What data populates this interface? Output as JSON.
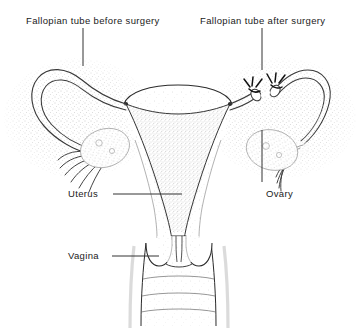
{
  "figure": {
    "background_color": "#ffffff",
    "ink_color": "#1a1a1a",
    "stipple_color": "#8d8d8d",
    "width": 357,
    "height": 333
  },
  "labels": {
    "fallopian_tube_before": "Fallopian tube before surgery",
    "fallopian_tube_after": "Fallopian tube after surgery",
    "uterus": "Uterus",
    "vagina": "Vagina",
    "ovary": "Ovary"
  },
  "leader_lines": [
    {
      "name": "leader-fallopian-before",
      "orientation": "vertical",
      "x1": 83,
      "y1": 28,
      "x2": 83,
      "y2": 66
    },
    {
      "name": "leader-fallopian-after",
      "orientation": "vertical",
      "x1": 262,
      "y1": 28,
      "x2": 262,
      "y2": 70
    },
    {
      "name": "leader-uterus",
      "orientation": "horizontal",
      "x1": 113,
      "y1": 194,
      "x2": 182,
      "y2": 194
    },
    {
      "name": "leader-vagina",
      "orientation": "horizontal",
      "x1": 112,
      "y1": 256,
      "x2": 159,
      "y2": 256
    },
    {
      "name": "leader-ovary",
      "orientation": "vertical",
      "x1": 262,
      "y1": 130,
      "x2": 262,
      "y2": 182
    }
  ],
  "anatomy": {
    "uterus_fundus": "dome-shaped top of uterine body",
    "uterine_cavity": "triangular stippled endometrial cavity",
    "cervix": "cervix protruding into vaginal canal",
    "vaginal_canal": "vaginal walls with transverse rugae folds",
    "left_side_state": "intact continuous fallopian tube with fimbriae over ovary",
    "right_side_state": "fallopian tube cut and ligated, two tied stumps with suture knots",
    "left_ovary": "ovary embraced by fimbriae",
    "right_ovary": "ovary embraced by fimbriae"
  }
}
